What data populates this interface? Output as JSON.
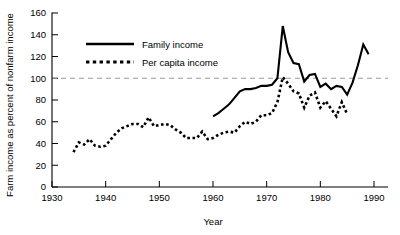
{
  "chart_data": {
    "type": "line",
    "title": "",
    "xlabel": "Year",
    "ylabel": "Farm income as percent of nonfarm income",
    "xlim": [
      1930,
      1990
    ],
    "ylim": [
      0,
      160
    ],
    "xticks": [
      1930,
      1940,
      1950,
      1960,
      1970,
      1980,
      1990
    ],
    "yticks": [
      0,
      20,
      40,
      60,
      80,
      100,
      120,
      140,
      160
    ],
    "grid": false,
    "legend_position": "upper-left-inside",
    "reference_line": {
      "y": 100,
      "style": "dashed",
      "color": "#9a9a9a"
    },
    "series": [
      {
        "name": "Family income",
        "style": "solid",
        "color": "#000000",
        "x": [
          1960,
          1961,
          1962,
          1963,
          1964,
          1965,
          1966,
          1967,
          1968,
          1969,
          1970,
          1971,
          1972,
          1973,
          1974,
          1975,
          1976,
          1977,
          1978,
          1979,
          1980,
          1981,
          1982,
          1983,
          1984,
          1985,
          1986,
          1987,
          1988,
          1989
        ],
        "values": [
          65,
          68,
          72,
          76,
          82,
          88,
          90,
          90,
          91,
          93,
          93,
          94,
          100,
          148,
          124,
          114,
          113,
          97,
          103,
          104,
          92,
          95,
          90,
          93,
          92,
          85,
          96,
          112,
          131,
          122
        ]
      },
      {
        "name": "Per capita income",
        "style": "dotted",
        "color": "#000000",
        "x": [
          1934,
          1935,
          1936,
          1937,
          1938,
          1939,
          1940,
          1941,
          1942,
          1943,
          1944,
          1945,
          1946,
          1947,
          1948,
          1949,
          1950,
          1951,
          1952,
          1953,
          1954,
          1955,
          1956,
          1957,
          1958,
          1959,
          1960,
          1961,
          1962,
          1963,
          1964,
          1965,
          1966,
          1967,
          1968,
          1969,
          1970,
          1971,
          1972,
          1973,
          1974,
          1975,
          1976,
          1977,
          1978,
          1979,
          1980,
          1981,
          1982,
          1983,
          1984,
          1985
        ],
        "values": [
          32,
          41,
          39,
          44,
          38,
          37,
          38,
          44,
          50,
          54,
          56,
          58,
          58,
          55,
          64,
          56,
          57,
          58,
          57,
          53,
          50,
          45,
          45,
          45,
          51,
          44,
          45,
          48,
          50,
          51,
          50,
          56,
          60,
          58,
          60,
          66,
          66,
          68,
          78,
          101,
          95,
          88,
          86,
          73,
          84,
          87,
          73,
          79,
          72,
          65,
          78,
          67
        ]
      }
    ]
  },
  "axes": {
    "y_label": "Farm income as percent of nonfarm income",
    "x_label": "Year",
    "x_tick_labels": [
      "1930",
      "1940",
      "1950",
      "1960",
      "1970",
      "1980",
      "1990"
    ],
    "y_tick_labels": [
      "0",
      "20",
      "40",
      "60",
      "80",
      "100",
      "120",
      "140",
      "160"
    ]
  },
  "legend": {
    "entries": [
      {
        "label": "Family income",
        "style": "solid"
      },
      {
        "label": "Per capita income",
        "style": "dotted"
      }
    ]
  }
}
